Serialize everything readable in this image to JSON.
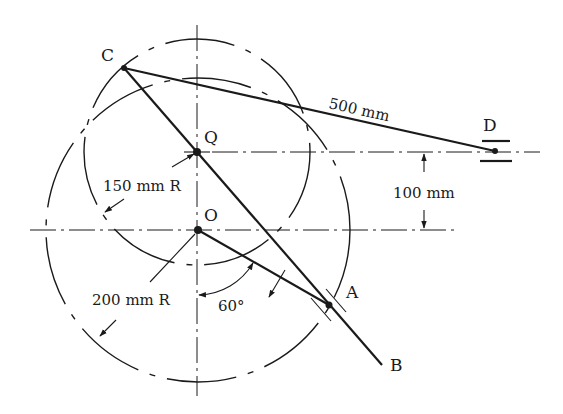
{
  "diagram": {
    "type": "mechanism-linkage",
    "points": {
      "C": {
        "label": "C",
        "x": 124,
        "y": 68
      },
      "Q": {
        "label": "Q",
        "x": 197,
        "y": 152
      },
      "O": {
        "label": "O",
        "x": 198,
        "y": 230
      },
      "A": {
        "label": "A",
        "x": 329,
        "y": 305
      },
      "B": {
        "label": "B",
        "x": 382,
        "y": 365
      },
      "D": {
        "label": "D",
        "x": 495,
        "y": 151
      }
    },
    "links": [
      {
        "name": "link-CD",
        "from": "C",
        "to": "D",
        "length_label": "500 mm"
      },
      {
        "name": "link-CB",
        "from": "C",
        "to": "B"
      },
      {
        "name": "crank-OA",
        "from": "O",
        "to": "A"
      }
    ],
    "circles": [
      {
        "name": "circle-Q",
        "center": "Q",
        "radius_label": "150 mm R"
      },
      {
        "name": "circle-O",
        "center": "O",
        "radius_label": "200 mm R"
      }
    ],
    "dimensions": {
      "offset_label": "100 mm",
      "angle_label": "60°"
    },
    "labels": {
      "C": "C",
      "Q": "Q",
      "O": "O",
      "A": "A",
      "B": "B",
      "D": "D",
      "cd_length": "500 mm",
      "offset": "100 mm",
      "q_radius": "150 mm R",
      "o_radius": "200 mm R",
      "angle": "60°"
    }
  }
}
